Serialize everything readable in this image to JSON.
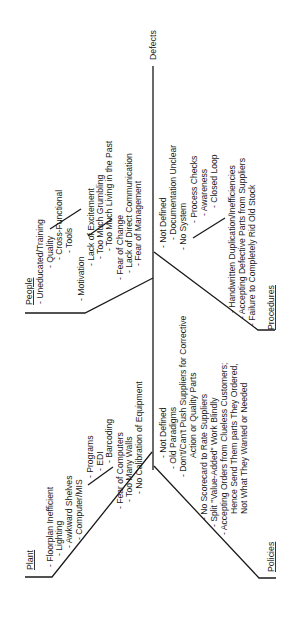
{
  "diagram": {
    "type": "fishbone",
    "orientation": "rotated-90-ccw",
    "effect": "Defects",
    "categories": {
      "people": {
        "title": "People",
        "items": [
          "- Uneducated/Training",
          "- Quality",
          "- Cross-Functional",
          "- Tools",
          "- Motivation",
          "- Lack of Excitement",
          "- Too Much Grumbling",
          "- Too Much Living in the Past",
          "- Fear of Change",
          "- Lack of Direct Communication",
          "- Fear of Management"
        ]
      },
      "procedures": {
        "title": "Procedures",
        "items": [
          "- Not Defined",
          "- Documentation Unclear",
          "- No System",
          "- Process Checks",
          "- Awareness",
          "- Closed Loop",
          "- Handwritten Duplication/Inefficiencies",
          "- Accepting Defective Parts from Suppliers",
          "- Failure to Completely Rid Old Stock"
        ]
      },
      "plant": {
        "title": "Plant",
        "items": [
          "- Floorplan Inefficient",
          "- Lighting",
          "- Awkward Shelves",
          "- Computer/MIS",
          "- Programs",
          "- EDI",
          "- Barcoding",
          "- Fear of Computers",
          "- Too Many Walls",
          "- No Calibration of Equipment"
        ]
      },
      "policies": {
        "title": "Policies",
        "items": [
          "- Not Defined",
          "- Old Paradigms",
          "- Don't/Can't Push Suppliers for Corrective",
          "Action or Quality Parts",
          "- No Scorecard to Rate Suppliers",
          "- Split \"Value-Added\" Work Blindly",
          "- Accepting Orders from Clueless Customers;",
          "Hence Send Them parts They Ordered,",
          "Not What They Wanted or Needed"
        ]
      }
    }
  }
}
